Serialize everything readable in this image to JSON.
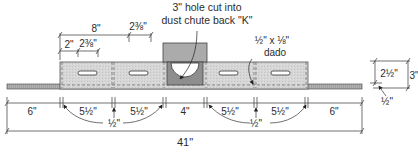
{
  "diagram": {
    "title_note": {
      "line1": "3\" hole cut into",
      "line2": "dust chute back \"K\""
    },
    "dado_note": {
      "line1": "½\" x ⅛\"",
      "line2": "dado"
    },
    "top_dimensions": {
      "overall_to_second_slot": "8\"",
      "slot_length_upper": "2⅜\"",
      "edge_to_slot": "2\"",
      "slot_length_lower": "2⅜\""
    },
    "bottom_dimensions": {
      "left_margin": "6\"",
      "seg1": "5½\"",
      "seg2": "5½\"",
      "center": "4\"",
      "seg3": "5½\"",
      "seg4": "5½\"",
      "right_margin": "6\"",
      "dado_left": "½\"",
      "dado_right": "½\"",
      "overall": "41\""
    },
    "side_dimensions": {
      "panel_height": "2½\"",
      "overall_height": "3\"",
      "base_thickness": "½\""
    },
    "colors": {
      "panel_fill": "#d4d4d4",
      "chute_fill": "#a9a9a9",
      "chute_inner": "#8c8c8c",
      "base_fill": "#9a9a9a",
      "line": "#333333"
    }
  }
}
